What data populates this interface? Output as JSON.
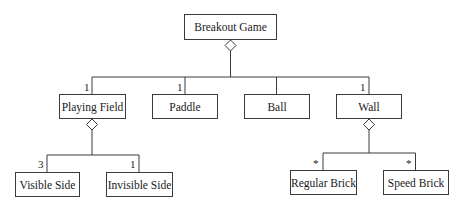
{
  "diagram": {
    "type": "uml-class-aggregation",
    "root": {
      "label": "Breakout Game"
    },
    "level1": [
      {
        "label": "Playing Field",
        "multiplicity": "1"
      },
      {
        "label": "Paddle",
        "multiplicity": "1"
      },
      {
        "label": "Ball",
        "multiplicity": ""
      },
      {
        "label": "Wall",
        "multiplicity": "1"
      }
    ],
    "playing_field_children": [
      {
        "label": "Visible Side",
        "multiplicity": "3"
      },
      {
        "label": "Invisible Side",
        "multiplicity": "1"
      }
    ],
    "wall_children": [
      {
        "label": "Regular Brick",
        "multiplicity": "*"
      },
      {
        "label": "Speed Brick",
        "multiplicity": "*"
      }
    ],
    "colors": {
      "line": "#3a3a3a",
      "background": "#ffffff",
      "text": "#1a1a1a"
    }
  }
}
